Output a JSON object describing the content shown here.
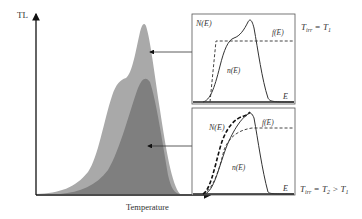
{
  "figure": {
    "y_axis_label": "TL",
    "x_axis_label": "Temperature",
    "colors": {
      "peak_unirradiated": "#a9a9a9",
      "peak_irradiated": "#7f7f7f",
      "axis": "#111111",
      "box_border": "#555555"
    }
  },
  "panels": [
    {
      "id": "top",
      "y_label": "N(E)",
      "x_label": "E",
      "f_label": "f(E)",
      "n_label": "n(E)",
      "condition_T": "T",
      "condition_sub": "irr",
      "condition_rest": " = T",
      "condition_sub2": "1",
      "condition_tail": ""
    },
    {
      "id": "bottom",
      "y_label": "N(E)",
      "x_label": "E",
      "f_label": "f(E)",
      "n_label": "n(E)",
      "condition_T": "T",
      "condition_sub": "irr",
      "condition_rest": " = T",
      "condition_sub2": "2",
      "condition_tail": " > T",
      "condition_sub3": "1"
    }
  ]
}
